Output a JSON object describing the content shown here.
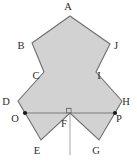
{
  "figure": {
    "fill_color": "#d2d2d2",
    "stroke_color": "#6f6f6f",
    "axis_color": "#9a9a9a",
    "label_color": "#2b2b2b",
    "background_color": "#ffffff",
    "canvas": {
      "width": 137,
      "height": 163
    },
    "vertices": [
      {
        "id": "A",
        "label": "A",
        "x": 70,
        "y": 16,
        "label_x": 68,
        "label_y": 10
      },
      {
        "id": "B",
        "label": "B",
        "x": 32,
        "y": 43,
        "label_x": 21,
        "label_y": 49
      },
      {
        "id": "C",
        "label": "C",
        "x": 44,
        "y": 72,
        "label_x": 36,
        "label_y": 79
      },
      {
        "id": "D",
        "label": "D",
        "x": 18,
        "y": 101,
        "label_x": 6,
        "label_y": 105
      },
      {
        "id": "E",
        "label": "E",
        "x": 41,
        "y": 140,
        "label_x": 37,
        "label_y": 154
      },
      {
        "id": "F",
        "label": "F",
        "x": 70,
        "y": 113,
        "label_x": 64,
        "label_y": 127
      },
      {
        "id": "G",
        "label": "G",
        "x": 99,
        "y": 140,
        "label_x": 96,
        "label_y": 154
      },
      {
        "id": "H",
        "label": "H",
        "x": 122,
        "y": 101,
        "label_x": 124,
        "label_y": 105
      },
      {
        "id": "I",
        "label": "I",
        "x": 96,
        "y": 72,
        "label_x": 98,
        "label_y": 79
      },
      {
        "id": "J",
        "label": "J",
        "x": 110,
        "y": 44,
        "label_x": 114,
        "label_y": 49
      }
    ],
    "marked_points": [
      {
        "id": "O",
        "label": "O",
        "x": 25,
        "y": 113,
        "label_x": 15,
        "label_y": 122
      },
      {
        "id": "P",
        "label": "P",
        "x": 115,
        "y": 113,
        "label_x": 118,
        "label_y": 122
      }
    ],
    "polygon_path": "70,16 110,44 96,72 122,101 99,140 70,113 41,140 18,101 44,72 32,43",
    "polygon_order": [
      "A",
      "J",
      "I",
      "H",
      "G",
      "F",
      "E",
      "D",
      "C",
      "B"
    ],
    "segments": [
      {
        "name": "chord-OP",
        "from": "O",
        "to": "P",
        "x1": 25,
        "y1": 113,
        "x2": 115,
        "y2": 113
      },
      {
        "name": "axis-AF",
        "from": "A",
        "to": "F",
        "x1": 70,
        "y1": 16,
        "x2": 70,
        "y2": 113
      },
      {
        "name": "axis-extension-below-F",
        "from": "F",
        "to": "",
        "x1": 70,
        "y1": 113,
        "x2": 70,
        "y2": 155
      }
    ],
    "right_angle_marker": {
      "name": "right-angle-at-F",
      "x": 70,
      "y": 113,
      "size": 5
    }
  }
}
